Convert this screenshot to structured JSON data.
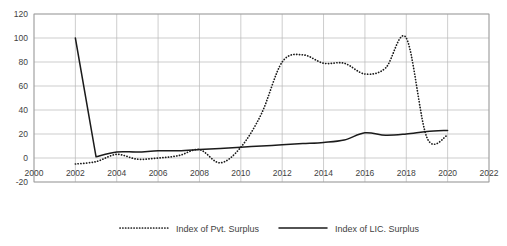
{
  "chart_data": {
    "type": "line",
    "title": "",
    "subtitle": "",
    "xlabel": "",
    "ylabel": "",
    "xlim": [
      2000,
      2022
    ],
    "ylim": [
      -20,
      120
    ],
    "x_ticks": [
      2000,
      2002,
      2004,
      2006,
      2008,
      2010,
      2012,
      2014,
      2016,
      2018,
      2020,
      2022
    ],
    "y_ticks": [
      -20,
      0,
      20,
      40,
      60,
      80,
      100,
      120
    ],
    "grid": true,
    "legend_position": "bottom",
    "x": [
      2002,
      2003,
      2004,
      2005,
      2006,
      2007,
      2008,
      2009,
      2010,
      2011,
      2012,
      2013,
      2014,
      2015,
      2016,
      2017,
      2018,
      2019,
      2020
    ],
    "series": [
      {
        "name": "Index of Pvt. Surplus",
        "style": "dotted",
        "color": "#1b1b1b",
        "values": [
          -5,
          -3,
          3,
          -1,
          0,
          2,
          7,
          -4,
          9,
          37,
          80,
          86,
          79,
          79,
          70,
          75,
          100,
          17,
          19
        ]
      },
      {
        "name": "Index of LIC. Surplus",
        "style": "solid",
        "color": "#1b1b1b",
        "values": [
          100,
          1,
          5,
          5,
          6,
          6,
          7,
          8,
          9,
          10,
          11,
          12,
          13,
          15,
          21,
          19,
          20,
          22,
          23
        ]
      }
    ]
  },
  "legend": {
    "items": [
      {
        "label": "Index of Pvt. Surplus",
        "marker": "dotted-line-swatch"
      },
      {
        "label": "Index of LIC. Surplus",
        "marker": "solid-line-swatch"
      }
    ]
  },
  "axes": {
    "x_tick_labels": [
      "2000",
      "2002",
      "2004",
      "2006",
      "2008",
      "2010",
      "2012",
      "2014",
      "2016",
      "2018",
      "2020",
      "2022"
    ],
    "y_tick_labels": [
      "120",
      "100",
      "80",
      "60",
      "40",
      "20",
      "0",
      "-20"
    ]
  }
}
